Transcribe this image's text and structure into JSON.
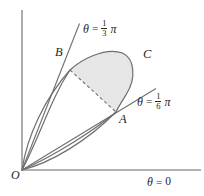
{
  "figure": {
    "type": "polar-curve-diagram",
    "background_color": "#ffffff",
    "axes": {
      "origin_label": "O",
      "x_axis_label_theta": "θ",
      "x_axis_label_eq": "=",
      "x_axis_label_value": "0",
      "axis_color": "#999999",
      "x_axis_from": [
        22,
        170
      ],
      "x_axis_to": [
        200,
        170
      ],
      "y_axis_from": [
        22,
        10
      ],
      "y_axis_to": [
        22,
        170
      ]
    },
    "points": [
      {
        "label": "B",
        "x": 70,
        "y": 70,
        "label_x": 56,
        "label_y": 50
      },
      {
        "label": "C",
        "x": 133,
        "y": 75,
        "label_x": 142,
        "label_y": 52
      },
      {
        "label": "A",
        "x": 116,
        "y": 112,
        "label_x": 119,
        "label_y": 113
      }
    ],
    "rays": [
      {
        "name": "ray-theta-one-third-pi",
        "theta_symbol": "θ",
        "equals": "=",
        "numerator": "1",
        "denominator": "3",
        "pi_symbol": "π",
        "label_x": 88,
        "label_y": 23,
        "from": [
          22,
          170
        ],
        "to": [
          79,
          24
        ]
      },
      {
        "name": "ray-theta-one-sixth-pi",
        "theta_symbol": "θ",
        "equals": "=",
        "numerator": "1",
        "denominator": "6",
        "pi_symbol": "π",
        "label_x": 140,
        "label_y": 96,
        "from": [
          22,
          170
        ],
        "to": [
          156,
          89
        ]
      }
    ],
    "curve": {
      "name": "closed-polar-loop",
      "stroke_color": "#6e6e6e",
      "path": "M 22 170 C 36 142 48 104 62 82 C 68 72 76 62 88 55 C 104 46 124 50 131 64 C 138 79 130 96 118 107 C 100 124 60 152 22 170 Z"
    },
    "shaded_region": {
      "name": "sector-area-BCA",
      "fill_color": "#e6e6e6",
      "path": "M 70 70 C 80 61 104 47 122 53 C 134 58 136 78 126 94 C 121 102 118 107 116 112 Z"
    },
    "chord": {
      "name": "chord-B-to-A",
      "style": "dashed",
      "from": [
        70,
        70
      ],
      "to": [
        116,
        112
      ]
    }
  }
}
